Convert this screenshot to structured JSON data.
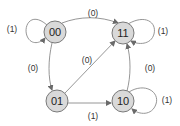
{
  "diagram": {
    "type": "state-diagram",
    "nodes": [
      {
        "id": "00",
        "label": "00"
      },
      {
        "id": "11",
        "label": "11"
      },
      {
        "id": "01",
        "label": "01"
      },
      {
        "id": "10",
        "label": "10"
      }
    ],
    "edges": [
      {
        "from": "00",
        "to": "00",
        "label": "(1)"
      },
      {
        "from": "00",
        "to": "11",
        "label": "(0)"
      },
      {
        "from": "00",
        "to": "01",
        "label": "(0)"
      },
      {
        "from": "01",
        "to": "11",
        "label": "(0)"
      },
      {
        "from": "11",
        "to": "11",
        "label": "(1)"
      },
      {
        "from": "10",
        "to": "11",
        "label": "(0)"
      },
      {
        "from": "01",
        "to": "10",
        "label": "(1)"
      },
      {
        "from": "10",
        "to": "10",
        "label": "(1)"
      }
    ],
    "colors": {
      "node_fill": "#d9d9d9",
      "node_stroke": "#7a7a7a",
      "edge": "#8a8a8a"
    }
  }
}
